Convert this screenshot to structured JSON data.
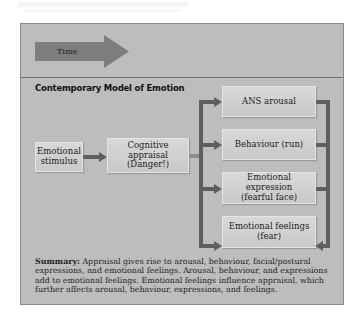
{
  "figure": {
    "time_label": "Time",
    "title": "Contemporary Model of Emotion",
    "nodes": {
      "stimulus": [
        "Emotional",
        "stimulus"
      ],
      "appraisal": [
        "Cognitive appraisal",
        "(Danger!)"
      ],
      "outcomes": [
        {
          "label": [
            "ANS arousal"
          ]
        },
        {
          "label": [
            "Behaviour (run)"
          ]
        },
        {
          "label": [
            "Emotional expression",
            "(fearful face)"
          ]
        },
        {
          "label": [
            "Emotional feelings",
            "(fear)"
          ]
        }
      ]
    },
    "summary_label": "Summary:",
    "summary_text": "Appraisal gives rise to arousal, behaviour, facial/postural expressions, and emotional feelings.  Arousal, behaviour, and expressions add to emotional feelings. Emotional feelings influence appraisal, which further affects arousal, behaviour, expressions, and feelings."
  },
  "colors": {
    "panel_bg": "#bdbdbd",
    "box_bg": "#d3d3d3",
    "connector": "#5e5e5e",
    "time_arrow": "#7a7a7a"
  }
}
